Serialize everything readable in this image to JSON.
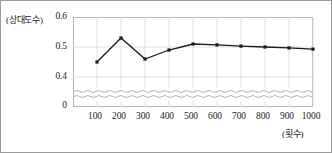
{
  "chart_data": {
    "type": "line",
    "title": "",
    "xlabel": "(횟수)",
    "ylabel": "(상대도수)",
    "x": [
      100,
      200,
      300,
      400,
      500,
      600,
      700,
      800,
      900,
      1000
    ],
    "values": [
      0.45,
      0.53,
      0.46,
      0.49,
      0.51,
      0.507,
      0.503,
      0.5,
      0.497,
      0.493
    ],
    "xtick_labels": [
      "100",
      "200",
      "300",
      "400",
      "500",
      "600",
      "700",
      "800",
      "900",
      "1000"
    ],
    "ytick_labels": [
      "0.6",
      "0.5",
      "0.4",
      "0"
    ],
    "ytick_values": [
      0.6,
      0.5,
      0.4,
      0.0
    ],
    "ylim": [
      0.4,
      0.6
    ],
    "xlim": [
      0,
      1000
    ],
    "grid": true,
    "axis_break": true,
    "legend": "",
    "series_color": "#1a1a1a",
    "grid_color": "#d8d8d8",
    "frame_color": "#b6b6b6"
  },
  "axes": {
    "y_title": "(상대도수)",
    "x_title": "(횟수)"
  }
}
